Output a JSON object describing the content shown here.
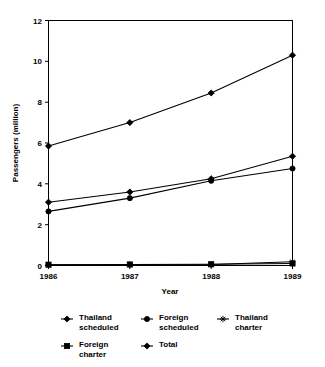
{
  "chart_data": {
    "type": "line",
    "title": "",
    "xlabel": "Year",
    "ylabel": "Passengers (million)",
    "categories": [
      "1986",
      "1987",
      "1988",
      "1989"
    ],
    "x": [
      1986,
      1987,
      1988,
      1989
    ],
    "xlim": [
      1986,
      1989
    ],
    "ylim": [
      0,
      12
    ],
    "yticks": [
      0,
      2,
      4,
      6,
      8,
      10,
      12
    ],
    "ytick_labels": [
      "0",
      "2",
      "4",
      "6",
      "8",
      "10",
      "12"
    ],
    "grid": false,
    "legend_position": "bottom",
    "series": [
      {
        "name": "Thailand scheduled",
        "marker": "diamond",
        "values": [
          3.1,
          3.6,
          4.25,
          5.35
        ]
      },
      {
        "name": "Foreign scheduled",
        "marker": "circle",
        "values": [
          2.65,
          3.3,
          4.15,
          4.75
        ]
      },
      {
        "name": "Thailand charter",
        "marker": "asterisk",
        "values": [
          0.03,
          0.04,
          0.05,
          0.18
        ]
      },
      {
        "name": "Foreign charter",
        "marker": "square",
        "values": [
          0.04,
          0.05,
          0.06,
          0.1
        ]
      },
      {
        "name": "Total",
        "marker": "diamond",
        "values": [
          5.85,
          7.0,
          8.45,
          10.3
        ]
      }
    ]
  },
  "axes": {
    "y_title": "Passengers (million)",
    "x_title": "Year",
    "y_ticks": [
      "12",
      "10",
      "8",
      "6",
      "4",
      "2",
      "0"
    ],
    "x_ticks": [
      "1986",
      "1987",
      "1988",
      "1989"
    ]
  },
  "legend": {
    "entries": [
      {
        "label_line1": "Thailand",
        "label_line2": "scheduled",
        "marker": "diamond-marker"
      },
      {
        "label_line1": "Foreign",
        "label_line2": "scheduled",
        "marker": "circle-marker"
      },
      {
        "label_line1": "Thailand",
        "label_line2": "charter",
        "marker": "asterisk-marker"
      },
      {
        "label_line1": "Foreign",
        "label_line2": "charter",
        "marker": "square-marker"
      },
      {
        "label_line1": "Total",
        "label_line2": "",
        "marker": "diamond-marker"
      }
    ]
  },
  "colors": {
    "line": "#000000",
    "background": "#ffffff",
    "frame": "#000000"
  }
}
